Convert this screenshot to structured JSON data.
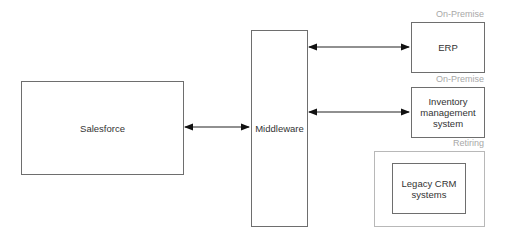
{
  "diagram": {
    "nodes": {
      "salesforce": {
        "label": "Salesforce"
      },
      "middleware": {
        "label": "Middleware"
      },
      "erp": {
        "label": "ERP",
        "tag": "On-Premise"
      },
      "inventory": {
        "label": "Inventory management system",
        "tag": "On-Premise"
      },
      "legacy": {
        "label": "Legacy CRM systems",
        "group_tag": "Retiring"
      }
    },
    "edges": [
      {
        "from": "salesforce",
        "to": "middleware",
        "type": "bidirectional"
      },
      {
        "from": "middleware",
        "to": "erp",
        "type": "bidirectional"
      },
      {
        "from": "middleware",
        "to": "inventory",
        "type": "bidirectional"
      }
    ],
    "colors": {
      "stroke": "#6e6e6e",
      "tag_text": "#a8a8a8",
      "group_border": "#b8b8b8"
    }
  }
}
